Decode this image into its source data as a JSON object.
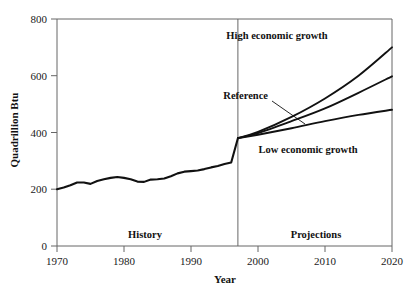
{
  "chart_data": {
    "type": "line",
    "title": "",
    "xlabel": "Year",
    "ylabel": "Quadrillion Btu",
    "xlim": [
      1970,
      2020
    ],
    "ylim": [
      0,
      800
    ],
    "xticks": [
      1970,
      1980,
      1990,
      2000,
      2010,
      2020
    ],
    "yticks": [
      0,
      200,
      400,
      600,
      800
    ],
    "grid": false,
    "legend_position": "inline-annotations",
    "divider": {
      "x": 1997,
      "history_label": "History",
      "projection_label": "Projections"
    },
    "series": [
      {
        "name": "History",
        "label": "",
        "x": [
          1970,
          1971,
          1972,
          1973,
          1974,
          1975,
          1976,
          1977,
          1978,
          1979,
          1980,
          1981,
          1982,
          1983,
          1984,
          1985,
          1986,
          1987,
          1988,
          1989,
          1990,
          1991,
          1992,
          1993,
          1994,
          1995,
          1996,
          1997
        ],
        "values": [
          200,
          206,
          214,
          224,
          224,
          219,
          229,
          235,
          240,
          243,
          240,
          235,
          227,
          226,
          234,
          235,
          238,
          246,
          256,
          262,
          264,
          266,
          271,
          277,
          282,
          289,
          294,
          380
        ]
      },
      {
        "name": "High economic growth",
        "label": "High economic growth",
        "x": [
          1997,
          2000,
          2005,
          2010,
          2015,
          2020
        ],
        "values": [
          380,
          402,
          455,
          520,
          600,
          700
        ]
      },
      {
        "name": "Reference",
        "label": "Reference",
        "x": [
          1997,
          2000,
          2005,
          2010,
          2015,
          2020
        ],
        "values": [
          380,
          398,
          440,
          485,
          540,
          598
        ]
      },
      {
        "name": "Low economic growth",
        "label": "Low economic growth",
        "x": [
          1997,
          2000,
          2005,
          2010,
          2015,
          2020
        ],
        "values": [
          380,
          392,
          415,
          440,
          462,
          480
        ]
      }
    ],
    "annotations": [
      {
        "name": "high-growth-label",
        "text": "High economic growth",
        "x": 2004.6,
        "y": 745
      },
      {
        "name": "reference-label",
        "text": "Reference",
        "x": 1997.2,
        "y": 520,
        "leader": true
      },
      {
        "name": "low-growth-label",
        "text": "Low economic growth",
        "x": 1999.0,
        "y": 355
      }
    ]
  },
  "axis": {
    "y_title": "Quadrillion Btu",
    "x_title": "Year",
    "xtick_labels": [
      "1970",
      "1980",
      "1990",
      "2000",
      "2010",
      "2020"
    ],
    "ytick_labels": [
      "0",
      "200",
      "400",
      "600",
      "800"
    ]
  },
  "regions": {
    "history": "History",
    "projections": "Projections"
  },
  "colors": {
    "line": "#111111",
    "axis": "#555555",
    "background": "#ffffff"
  }
}
